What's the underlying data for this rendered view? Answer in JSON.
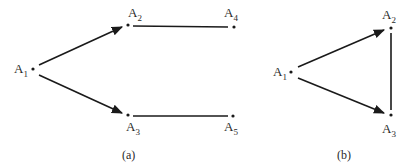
{
  "figure": {
    "graphs": [
      {
        "id": "a",
        "caption": "(a)",
        "nodes": [
          {
            "name": "A",
            "sub": "1",
            "x": 33,
            "y": 69
          },
          {
            "name": "A",
            "sub": "2",
            "x": 128,
            "y": 25
          },
          {
            "name": "A",
            "sub": "3",
            "x": 128,
            "y": 115
          },
          {
            "name": "A",
            "sub": "4",
            "x": 234,
            "y": 27
          },
          {
            "name": "A",
            "sub": "5",
            "x": 233,
            "y": 116
          }
        ],
        "edges": [
          {
            "from": "A1",
            "to": "A2",
            "directed": true
          },
          {
            "from": "A1",
            "to": "A3",
            "directed": true
          },
          {
            "from": "A2",
            "to": "A4",
            "directed": false
          },
          {
            "from": "A3",
            "to": "A5",
            "directed": false
          }
        ]
      },
      {
        "id": "b",
        "caption": "(b)",
        "nodes": [
          {
            "name": "A",
            "sub": "1",
            "x": 291,
            "y": 72
          },
          {
            "name": "A",
            "sub": "2",
            "x": 391,
            "y": 28
          },
          {
            "name": "A",
            "sub": "3",
            "x": 391,
            "y": 115
          }
        ],
        "edges": [
          {
            "from": "A1",
            "to": "A2",
            "directed": true
          },
          {
            "from": "A1",
            "to": "A3",
            "directed": true
          },
          {
            "from": "A2",
            "to": "A3",
            "directed": false
          }
        ]
      }
    ]
  }
}
